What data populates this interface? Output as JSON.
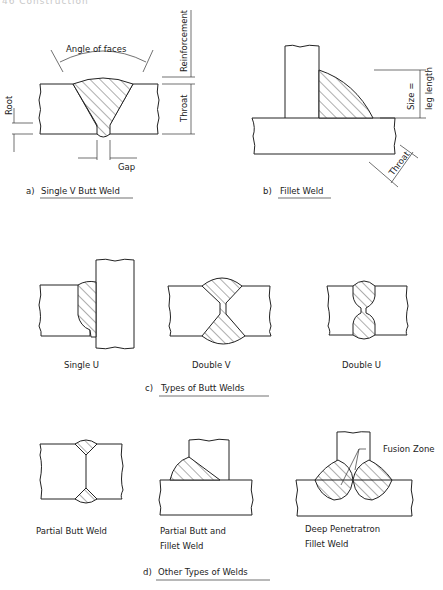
{
  "page_header": "46   Construction",
  "figures": {
    "a": {
      "caption_prefix": "a)",
      "caption": "Single  V  Butt  Weld",
      "labels": {
        "angle_of_faces": "Angle of faces",
        "reinforcement": "Reinforcement",
        "throat": "Throat",
        "root": "Root",
        "gap": "Gap"
      }
    },
    "b": {
      "caption_prefix": "b)",
      "caption": "Fillet  Weld",
      "labels": {
        "size_line1": "Size =",
        "size_line2": "leg length",
        "throat": "Throat"
      }
    },
    "c": {
      "caption_prefix": "c)",
      "caption": "Types  of  Butt  Welds",
      "items": [
        {
          "label": "Single  U"
        },
        {
          "label": "Double  V"
        },
        {
          "label": "Double  U"
        }
      ]
    },
    "d": {
      "caption_prefix": "d)",
      "caption": "Other  Types  of  Welds",
      "items": [
        {
          "label_line1": "Partial  Butt  Weld",
          "label_line2": ""
        },
        {
          "label_line1": "Partial  Butt  and",
          "label_line2": "Fillet  Weld"
        },
        {
          "label_line1": "Deep  Penetratron",
          "label_line2": "Fillet  Weld"
        }
      ],
      "annotation": "Fusion  Zone"
    }
  }
}
